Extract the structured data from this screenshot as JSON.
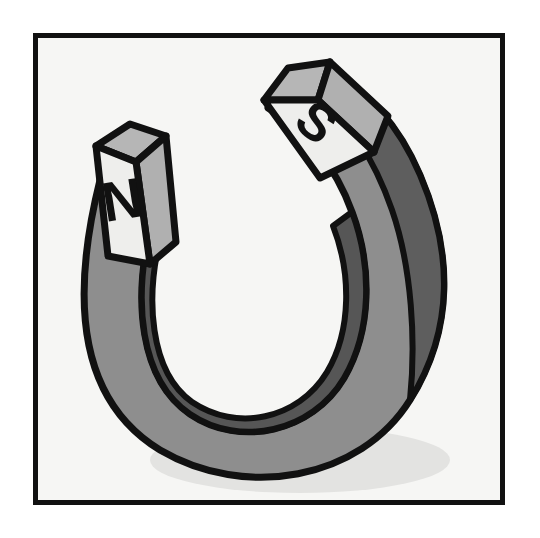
{
  "figure": {
    "name": "horseshoe-magnet-illustration",
    "orientation": "U-shape opening upward, tilted slightly clockwise",
    "frame": {
      "name": "picture-frame-border",
      "color": "#111111",
      "thickness_px": 5,
      "x": 33,
      "y": 33,
      "width": 472,
      "height": 472
    },
    "canvas": {
      "background_color": "#f6f6f4",
      "width": 540,
      "height": 538
    },
    "ground_shadow": {
      "name": "floor-shadow-ellipse",
      "color": "#e3e3e1",
      "cx": 300,
      "cy": 460,
      "rx": 150,
      "ry": 33
    }
  },
  "magnet": {
    "name": "horseshoe-magnet",
    "outline_color": "#111111",
    "outline_width_px": 7,
    "body_color": "#8e8e8e",
    "inner_face_color": "#565656",
    "outer_shade_color": "#5e5e5e",
    "top_face_color": "#b6b6b6",
    "pole_face_color": "#eeeeec",
    "pole_side_color": "#b0b0b0",
    "poles": [
      {
        "id": "north",
        "label": "N",
        "label_color": "#111111",
        "position": "left arm, upper end",
        "rotation_deg": -8,
        "face_color": "#eeeeec"
      },
      {
        "id": "south",
        "label": "S",
        "label_color": "#111111",
        "position": "right arm, upper end",
        "rotation_deg": 38,
        "face_color": "#eeeeec"
      }
    ]
  }
}
